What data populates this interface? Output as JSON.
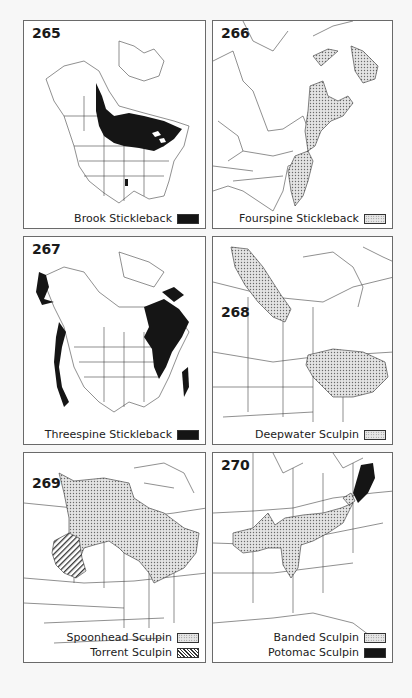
{
  "page": {
    "background": "#f7f7f7"
  },
  "colors": {
    "solid": "#151515",
    "stipple": "#d8d8d8",
    "line": "#333333"
  },
  "maps": [
    {
      "number": "265",
      "legend": [
        {
          "label": "Brook Stickleback",
          "pattern": "solid"
        }
      ]
    },
    {
      "number": "266",
      "legend": [
        {
          "label": "Fourspine Stickleback",
          "pattern": "stipple"
        }
      ]
    },
    {
      "number": "267",
      "legend": [
        {
          "label": "Threespine Stickleback",
          "pattern": "solid"
        }
      ]
    },
    {
      "number": "268",
      "legend": [
        {
          "label": "Deepwater Sculpin",
          "pattern": "stipple"
        }
      ]
    },
    {
      "number": "269",
      "legend": [
        {
          "label": "Spoonhead Sculpin",
          "pattern": "stipple"
        },
        {
          "label": "Torrent Sculpin",
          "pattern": "hatch"
        }
      ]
    },
    {
      "number": "270",
      "legend": [
        {
          "label": "Banded Sculpin",
          "pattern": "stipple"
        },
        {
          "label": "Potomac Sculpin",
          "pattern": "solid"
        }
      ]
    }
  ]
}
